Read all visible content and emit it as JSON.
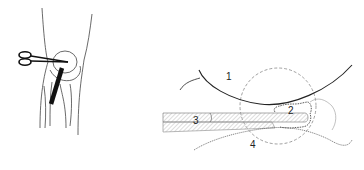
{
  "figure": {
    "left_panel": {
      "description": "Knee anterior view with scissors and arthroscope",
      "stroke_color": "#333333"
    },
    "right_panel": {
      "labels": [
        {
          "id": "1",
          "text": "1"
        },
        {
          "id": "2",
          "text": "2"
        },
        {
          "id": "3",
          "text": "3"
        },
        {
          "id": "4",
          "text": "4"
        }
      ],
      "colors": {
        "line": "#222222",
        "hatch": "#bbbbbb",
        "dashed_circle": "#888888"
      }
    }
  }
}
